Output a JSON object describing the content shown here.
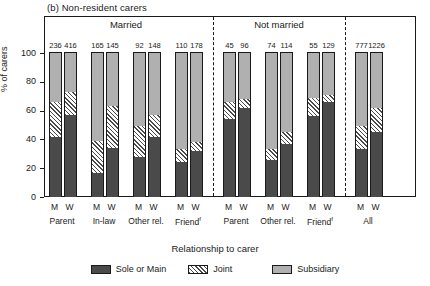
{
  "panel": {
    "title": "(b) Non-resident carers"
  },
  "axes": {
    "y_title": "% of carers",
    "y_ticks": [
      0,
      20,
      40,
      60,
      80,
      100
    ],
    "y_min": 0,
    "y_max": 100,
    "x_title": "Relationship to carer"
  },
  "legend": {
    "items": [
      {
        "label": "Sole or Main",
        "swatch": "solid-dark"
      },
      {
        "label": "Joint",
        "swatch": "hatched"
      },
      {
        "label": "Subsidiary",
        "swatch": "solid-light"
      }
    ]
  },
  "group_headers": [
    {
      "label": "Married"
    },
    {
      "label": "Not married"
    },
    {
      "label": ""
    }
  ],
  "chart_data": {
    "type": "bar",
    "subtype": "stacked-percentage",
    "title": "(b) Non-resident carers",
    "xlabel": "Relationship to carer",
    "ylabel": "% of carers",
    "ylim": [
      0,
      100
    ],
    "yticks": [
      0,
      20,
      40,
      60,
      80,
      100
    ],
    "grid": false,
    "legend_position": "below",
    "series": [
      {
        "name": "Sole or Main",
        "style": "solid-dark",
        "color": "#4a4a4a"
      },
      {
        "name": "Joint",
        "style": "hatched",
        "color": "#4a4a4a"
      },
      {
        "name": "Subsidiary",
        "style": "solid-light",
        "color": "#b0b0b0"
      }
    ],
    "groups": [
      {
        "header": "Married",
        "categories": [
          {
            "label": "Parent",
            "bars": [
              {
                "sex": "M",
                "n": "236",
                "sole_or_main": 42,
                "joint": 24,
                "subsidiary": 34
              },
              {
                "sex": "W",
                "n": "416",
                "sole_or_main": 57,
                "joint": 16,
                "subsidiary": 27
              }
            ]
          },
          {
            "label": "In-law",
            "bars": [
              {
                "sex": "M",
                "n": "165",
                "sole_or_main": 17,
                "joint": 22,
                "subsidiary": 61
              },
              {
                "sex": "W",
                "n": "145",
                "sole_or_main": 34,
                "joint": 29,
                "subsidiary": 37
              }
            ]
          },
          {
            "label": "Other rel.",
            "bars": [
              {
                "sex": "M",
                "n": "92",
                "sole_or_main": 28,
                "joint": 21,
                "subsidiary": 51
              },
              {
                "sex": "W",
                "n": "148",
                "sole_or_main": 42,
                "joint": 15,
                "subsidiary": 43
              }
            ]
          },
          {
            "label": "Friend",
            "superscript": "f",
            "bars": [
              {
                "sex": "M",
                "n": "110",
                "sole_or_main": 24,
                "joint": 9,
                "subsidiary": 67
              },
              {
                "sex": "W",
                "n": "178",
                "sole_or_main": 32,
                "joint": 6,
                "subsidiary": 62
              }
            ]
          }
        ]
      },
      {
        "header": "Not married",
        "categories": [
          {
            "label": "Parent",
            "bars": [
              {
                "sex": "M",
                "n": "45",
                "sole_or_main": 54,
                "joint": 12,
                "subsidiary": 34
              },
              {
                "sex": "W",
                "n": "96",
                "sole_or_main": 62,
                "joint": 6,
                "subsidiary": 32
              }
            ]
          },
          {
            "label": "Other rel.",
            "bars": [
              {
                "sex": "M",
                "n": "74",
                "sole_or_main": 26,
                "joint": 7,
                "subsidiary": 67
              },
              {
                "sex": "W",
                "n": "114",
                "sole_or_main": 37,
                "joint": 8,
                "subsidiary": 55
              }
            ]
          },
          {
            "label": "Friend",
            "superscript": "f",
            "bars": [
              {
                "sex": "M",
                "n": "55",
                "sole_or_main": 56,
                "joint": 13,
                "subsidiary": 31
              },
              {
                "sex": "W",
                "n": "129",
                "sole_or_main": 66,
                "joint": 5,
                "subsidiary": 29
              }
            ]
          }
        ]
      },
      {
        "header": "",
        "categories": [
          {
            "label": "All",
            "bars": [
              {
                "sex": "M",
                "n": "777",
                "sole_or_main": 33,
                "joint": 16,
                "subsidiary": 51
              },
              {
                "sex": "W",
                "n": "1226",
                "sole_or_main": 45,
                "joint": 17,
                "subsidiary": 38
              }
            ]
          }
        ]
      }
    ]
  }
}
